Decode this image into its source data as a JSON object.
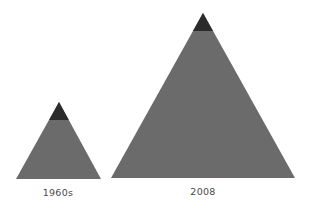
{
  "colors": {
    "background": "#ffffff",
    "pyramid_fill": "#6b6b6b",
    "pyramid_cap": "#2b2b2b",
    "label_text": "#4a4a4a"
  },
  "pyramids": [
    {
      "label": "1960s",
      "apex": [
        59,
        102
      ],
      "base_left": [
        16,
        179
      ],
      "base_right": [
        101,
        179
      ],
      "cap_bottom_y": 120
    },
    {
      "label": "2008",
      "apex": [
        203,
        13
      ],
      "base_left": [
        111,
        178
      ],
      "base_right": [
        295,
        178
      ],
      "cap_bottom_y": 31
    }
  ]
}
